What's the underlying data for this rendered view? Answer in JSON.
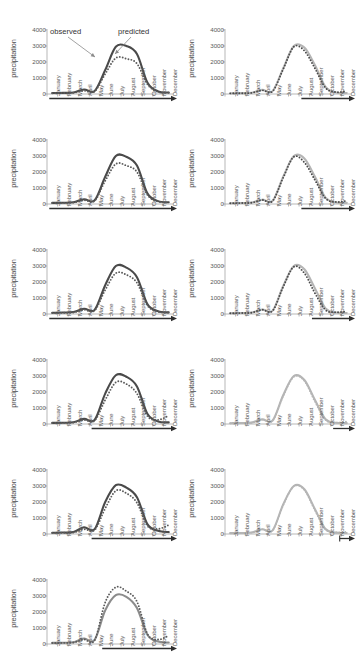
{
  "figure": {
    "axis_label_y": "precipitation",
    "y_ticks": [
      "4000",
      "3000",
      "2000",
      "1000",
      "0"
    ],
    "x_ticks": [
      "January",
      "February",
      "March",
      "April",
      "May",
      "June",
      "July",
      "August",
      "September",
      "October",
      "November",
      "December"
    ],
    "annotations": {
      "observed": "observed",
      "predicted": "predicted"
    },
    "colors": {
      "observed_line": "#4a4a4a",
      "predicted_dots": "#5a5a5a",
      "light_series": "#b5b5b5",
      "axis": "#2e2e2e",
      "text": "#4a4a4a"
    }
  },
  "chart_data": {
    "type": "line",
    "title": "",
    "xlabel": "",
    "ylabel": "precipitation",
    "ylim": [
      0,
      4000
    ],
    "y_tick_values": [
      0,
      1000,
      2000,
      3000,
      4000
    ],
    "grid": false,
    "legend": [
      "observed",
      "predicted"
    ],
    "categories": [
      "January",
      "February",
      "March",
      "April",
      "May",
      "June",
      "July",
      "August",
      "September",
      "October",
      "November",
      "December"
    ],
    "panels": [
      {
        "id": "panel-1",
        "column": "left",
        "row": 1,
        "annotated": true,
        "annotation_labels": [
          "observed",
          "predicted"
        ],
        "arrow_span": [
          "January",
          "December"
        ],
        "series": [
          {
            "name": "observed",
            "style": "solid",
            "color": "#4a4a4a",
            "values": [
              60,
              70,
              90,
              280,
              190,
              1500,
              2950,
              3000,
              2500,
              700,
              160,
              90
            ]
          },
          {
            "name": "predicted",
            "style": "dotted",
            "color": "#5a5a5a",
            "values": [
              50,
              60,
              80,
              200,
              160,
              1250,
              2250,
              2200,
              1900,
              600,
              130,
              80
            ]
          }
        ]
      },
      {
        "id": "panel-2",
        "column": "right",
        "row": 1,
        "annotated": false,
        "arrow_span": [
          "August",
          "December"
        ],
        "series": [
          {
            "name": "observed",
            "style": "solid",
            "color": "#b5b5b5",
            "values": [
              40,
              55,
              75,
              260,
              180,
              1600,
              3000,
              2900,
              1800,
              450,
              90,
              60
            ]
          },
          {
            "name": "predicted",
            "style": "dotted",
            "color": "#4a4a4a",
            "values": [
              40,
              50,
              70,
              230,
              170,
              1550,
              2950,
              2700,
              1600,
              380,
              120,
              180
            ]
          }
        ]
      },
      {
        "id": "panel-3",
        "column": "left",
        "row": 2,
        "annotated": false,
        "arrow_span": [
          "January",
          "December"
        ],
        "series": [
          {
            "name": "observed",
            "style": "solid",
            "color": "#4a4a4a",
            "values": [
              70,
              80,
              110,
              300,
              230,
              1700,
              3000,
              2950,
              2400,
              650,
              180,
              110
            ]
          },
          {
            "name": "predicted",
            "style": "dotted",
            "color": "#5a5a5a",
            "values": [
              60,
              70,
              95,
              240,
              200,
              1450,
              2500,
              2400,
              2000,
              560,
              150,
              95
            ]
          }
        ]
      },
      {
        "id": "panel-4",
        "column": "right",
        "row": 2,
        "annotated": false,
        "arrow_span": [
          "August",
          "December"
        ],
        "series": [
          {
            "name": "observed",
            "style": "solid",
            "color": "#b5b5b5",
            "values": [
              50,
              60,
              85,
              270,
              200,
              1700,
              3000,
              2850,
              1700,
              400,
              100,
              70
            ]
          },
          {
            "name": "predicted",
            "style": "dotted",
            "color": "#4a4a4a",
            "values": [
              50,
              58,
              80,
              250,
              190,
              1650,
              2950,
              2600,
              1500,
              350,
              130,
              200
            ]
          }
        ]
      },
      {
        "id": "panel-5",
        "column": "left",
        "row": 3,
        "annotated": false,
        "arrow_span": [
          "January",
          "December"
        ],
        "series": [
          {
            "name": "observed",
            "style": "solid",
            "color": "#4a4a4a",
            "values": [
              80,
              90,
              120,
              330,
              260,
              1800,
              3000,
              2900,
              2300,
              600,
              170,
              100
            ]
          },
          {
            "name": "predicted",
            "style": "dotted",
            "color": "#5a5a5a",
            "values": [
              65,
              75,
              100,
              260,
              220,
              1500,
              2550,
              2450,
              1950,
              520,
              140,
              90
            ]
          }
        ]
      },
      {
        "id": "panel-6",
        "column": "right",
        "row": 3,
        "annotated": false,
        "arrow_span": [
          "September",
          "December"
        ],
        "series": [
          {
            "name": "observed",
            "style": "solid",
            "color": "#b5b5b5",
            "values": [
              50,
              60,
              85,
              280,
              210,
              1750,
              3000,
              2800,
              1600,
              350,
              90,
              60
            ]
          },
          {
            "name": "predicted",
            "style": "dotted",
            "color": "#4a4a4a",
            "values": [
              50,
              58,
              82,
              265,
              200,
              1700,
              2950,
              2550,
              1300,
              250,
              110,
              170
            ]
          }
        ]
      },
      {
        "id": "panel-7",
        "column": "left",
        "row": 4,
        "annotated": false,
        "arrow_span": [
          "May",
          "December"
        ],
        "series": [
          {
            "name": "observed",
            "style": "solid",
            "color": "#4a4a4a",
            "values": [
              70,
              80,
              110,
              320,
              250,
              1900,
              3050,
              2950,
              2350,
              620,
              160,
              100
            ]
          },
          {
            "name": "predicted",
            "style": "dotted",
            "color": "#5a5a5a",
            "values": [
              60,
              70,
              95,
              250,
              210,
              1500,
              2600,
              2500,
              1900,
              480,
              260,
              520
            ]
          }
        ]
      },
      {
        "id": "panel-8",
        "column": "right",
        "row": 4,
        "annotated": false,
        "arrow_span": [
          "November",
          "December"
        ],
        "series": [
          {
            "name": "observed",
            "style": "solid",
            "color": "#b5b5b5",
            "values": [
              50,
              60,
              85,
              290,
              220,
              1800,
              3000,
              2750,
              1500,
              300,
              80,
              55
            ]
          },
          {
            "name": "predicted",
            "style": "dotted",
            "color": "#b5b5b5",
            "values": [
              50,
              58,
              82,
              275,
              210,
              1750,
              2950,
              2700,
              1400,
              260,
              90,
              150
            ]
          }
        ]
      },
      {
        "id": "panel-9",
        "column": "left",
        "row": 5,
        "annotated": false,
        "arrow_span": [
          "May",
          "December"
        ],
        "series": [
          {
            "name": "observed",
            "style": "solid",
            "color": "#4a4a4a",
            "values": [
              80,
              90,
              120,
              420,
              300,
              2000,
              3050,
              2900,
              2300,
              600,
              200,
              120
            ]
          },
          {
            "name": "predicted",
            "style": "dotted",
            "color": "#5a5a5a",
            "values": [
              70,
              80,
              100,
              300,
              250,
              1600,
              2700,
              2550,
              1950,
              500,
              320,
              560
            ]
          }
        ]
      },
      {
        "id": "panel-10",
        "column": "right",
        "row": 5,
        "annotated": false,
        "arrow_span": [
          "December",
          "December"
        ],
        "series": [
          {
            "name": "observed",
            "style": "solid",
            "color": "#b5b5b5",
            "values": [
              55,
              65,
              90,
              300,
              230,
              1850,
              3000,
              2800,
              1550,
              310,
              85,
              60
            ]
          },
          {
            "name": "predicted",
            "style": "dotted",
            "color": "#b5b5b5",
            "values": [
              55,
              62,
              88,
              290,
              225,
              1800,
              2980,
              2750,
              1480,
              280,
              95,
              130
            ]
          }
        ]
      },
      {
        "id": "panel-11",
        "column": "left",
        "row": 6,
        "annotated": false,
        "arrow_span": [
          "June",
          "December"
        ],
        "series": [
          {
            "name": "observed",
            "style": "solid",
            "color": "#8c8c8c",
            "values": [
              70,
              80,
              110,
              340,
              260,
              2100,
              3050,
              2950,
              2250,
              560,
              150,
              95
            ]
          },
          {
            "name": "predicted",
            "style": "dotted",
            "color": "#5a5a5a",
            "values": [
              60,
              70,
              95,
              280,
              230,
              2600,
              3550,
              3300,
              2650,
              620,
              280,
              520
            ]
          }
        ]
      }
    ]
  }
}
